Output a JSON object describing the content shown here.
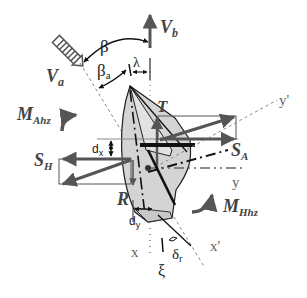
{
  "diagram": {
    "labels": {
      "va": {
        "main": "V",
        "sub": "a"
      },
      "vb": {
        "main": "V",
        "sub": "b"
      },
      "beta": "β",
      "beta_a": {
        "main": "β",
        "sub": "a"
      },
      "lambda": "λ",
      "m_ahz": {
        "main": "M",
        "sub": "Ahz"
      },
      "m_hhz": {
        "main": "M",
        "sub": "Hhz"
      },
      "t": "T",
      "r": "R",
      "s_h": {
        "main": "S",
        "sub": "H"
      },
      "s_a": {
        "main": "S",
        "sub": "A"
      },
      "dx": {
        "main": "d",
        "sub": "x"
      },
      "dy": {
        "main": "d",
        "sub": "y"
      },
      "delta_r": {
        "main": "δ",
        "sub": "r"
      },
      "xi": "ξ",
      "x_axis": "x",
      "x_prime_axis": "x'",
      "y_axis": "y",
      "y_prime_axis": "y'"
    },
    "colors": {
      "arrow": "#555555",
      "hull_fill": "#d4d4d4",
      "line_dark": "#111111",
      "dashed": "#888888"
    }
  }
}
